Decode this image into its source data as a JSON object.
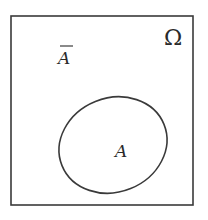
{
  "diagram": {
    "type": "venn",
    "universe": {
      "label": "Ω",
      "shape": "rectangle",
      "x": 11,
      "y": 16,
      "width": 182,
      "height": 189
    },
    "sets": [
      {
        "label": "A",
        "shape": "ellipse",
        "cx": 113,
        "cy": 145,
        "rx": 54,
        "ry": 47,
        "rotation": -20
      }
    ],
    "complement": {
      "label": "A",
      "overline": true,
      "meaning": "complement of A"
    },
    "colors": {
      "stroke": "#3a3a3a",
      "text": "#2a2a2a",
      "background": "#ffffff"
    }
  }
}
